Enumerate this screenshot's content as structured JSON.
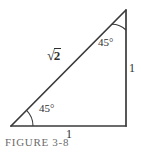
{
  "figure": {
    "caption": "FIGURE 3-8",
    "background_color": "#ffffff",
    "line_color": "#3a3a3a",
    "text_color": "#2e2e2e",
    "caption_color": "#6b6b6b",
    "shape": "right-triangle-45-45-90",
    "labels": {
      "angle_top": "45°",
      "angle_bottom_left": "45°",
      "leg_vertical": "1",
      "leg_base": "1",
      "hypotenuse_radical_sign": "√",
      "hypotenuse_radicand": "2"
    },
    "geometry": {
      "vertex_bottom_left": [
        11,
        126
      ],
      "vertex_bottom_right": [
        126,
        126
      ],
      "vertex_top_right": [
        126,
        10
      ],
      "arc_radius_bottom_left": 22,
      "arc_radius_top_right": 20,
      "stroke_width": 1.6
    }
  }
}
